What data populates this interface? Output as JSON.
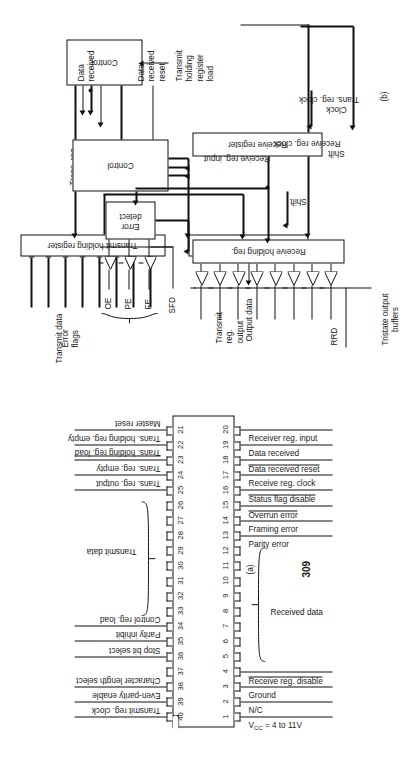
{
  "page": {
    "number": "309",
    "fig_a_caption": "(a)",
    "fig_b_caption": "(b)"
  },
  "pinout": {
    "left_pins": [
      {
        "num": "1",
        "label": "VCC = 4 to 11V",
        "overline": false
      },
      {
        "num": "2",
        "label": "N/C",
        "overline": false
      },
      {
        "num": "3",
        "label": "Ground",
        "overline": false
      },
      {
        "num": "4",
        "label": "Receive reg. disable",
        "overline": true
      },
      {
        "num": "5",
        "label": "",
        "overline": false
      },
      {
        "num": "6",
        "label": "",
        "overline": false
      },
      {
        "num": "7",
        "label": "",
        "overline": false
      },
      {
        "num": "8",
        "label": "",
        "overline": false
      },
      {
        "num": "9",
        "label": "",
        "overline": false
      },
      {
        "num": "10",
        "label": "",
        "overline": false
      },
      {
        "num": "11",
        "label": "",
        "overline": false
      },
      {
        "num": "12",
        "label": "",
        "overline": false
      },
      {
        "num": "13",
        "label": "Parity error",
        "overline": false
      },
      {
        "num": "14",
        "label": "Framing error",
        "overline": false
      },
      {
        "num": "15",
        "label": "Overrun error",
        "overline": true
      },
      {
        "num": "16",
        "label": "Status flag disable",
        "overline": true
      },
      {
        "num": "17",
        "label": "Receive reg. clock",
        "overline": false
      },
      {
        "num": "18",
        "label": "Data received reset",
        "overline": true
      },
      {
        "num": "19",
        "label": "Data received",
        "overline": false
      },
      {
        "num": "20",
        "label": "Receiver reg. input",
        "overline": false
      }
    ],
    "right_pins": [
      {
        "num": "40",
        "label": "Transmit reg. clock",
        "overline": false
      },
      {
        "num": "39",
        "label": "Even-parity enable",
        "overline": false
      },
      {
        "num": "38",
        "label": "Character length select",
        "overline": false
      },
      {
        "num": "37",
        "label": "",
        "overline": false
      },
      {
        "num": "36",
        "label": "Stop bit select",
        "overline": false
      },
      {
        "num": "35",
        "label": "Parity inhibit",
        "overline": false
      },
      {
        "num": "34",
        "label": "Control reg. load",
        "overline": false
      },
      {
        "num": "33",
        "label": "",
        "overline": false
      },
      {
        "num": "32",
        "label": "",
        "overline": false
      },
      {
        "num": "31",
        "label": "",
        "overline": false
      },
      {
        "num": "30",
        "label": "",
        "overline": false
      },
      {
        "num": "29",
        "label": "",
        "overline": false
      },
      {
        "num": "28",
        "label": "",
        "overline": false
      },
      {
        "num": "27",
        "label": "",
        "overline": false
      },
      {
        "num": "26",
        "label": "",
        "overline": false
      },
      {
        "num": "25",
        "label": "Trans. reg. output",
        "overline": false
      },
      {
        "num": "24",
        "label": "Trans. reg. empty",
        "overline": false
      },
      {
        "num": "23",
        "label": "Trans. holding reg. load",
        "overline": true
      },
      {
        "num": "22",
        "label": "Trans. holding reg. empty",
        "overline": false
      },
      {
        "num": "21",
        "label": "Master reset",
        "overline": false
      }
    ],
    "group_left_label": "Received data",
    "group_right_label": "Transmit data",
    "vcc_label": "V",
    "vcc_sub": "CC",
    "vcc_rest": " = 4 to 11V"
  },
  "transmitter": {
    "input_bus_label": "Transmit data",
    "holding_register": "Transmit holding register",
    "transmit_register": "Transmit register",
    "control": "Control",
    "output_label": "Transmit\nreg.\noutput",
    "output_l1": "Transmit",
    "output_l2": "reg.",
    "output_l3": "output",
    "shift": "Shift",
    "trans_reg_clock": "Trans. reg. clock",
    "trans_reg_empty_l1": "Trans. reg.",
    "trans_reg_empty_l2": "empty",
    "holding_load_l1": "Transmit",
    "holding_load_l2": "holding",
    "holding_load_l3": "register",
    "holding_load_l4": "load"
  },
  "receiver": {
    "rrd": "RRD",
    "tristate_l1": "Tristate output",
    "tristate_l2": "buffers",
    "output_data": "Output data",
    "holding_register": "Receive holding reg.",
    "receive_register": "Receive register",
    "control": "Control",
    "error_detect_l1": "Error",
    "error_detect_l2": "detect",
    "error_flags_l1": "Error",
    "error_flags_l2": "flags",
    "flag_oe": "OE",
    "flag_pe": "PE",
    "flag_fe": "FE",
    "sfd": "SFD",
    "clock": "Clock",
    "shift": "Shift",
    "receive_reg_input": "Receive reg. input",
    "receive_reg_clock": "Receive reg. clock",
    "data_received_l1": "Data",
    "data_received_l2": "received",
    "data_received_reset_l1": "Data",
    "data_received_reset_l2": "received",
    "data_received_reset_l3": "reset"
  },
  "colors": {
    "ink": "#111111",
    "paper": "#ffffff"
  }
}
